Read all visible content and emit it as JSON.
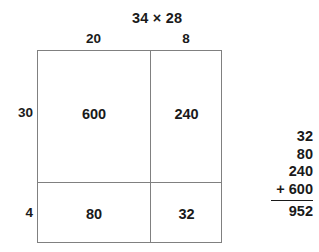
{
  "problem": {
    "title": "34 × 28",
    "multiplicand": "34",
    "multiplier": "28"
  },
  "area_model": {
    "column_headers": [
      "20",
      "8"
    ],
    "row_headers": [
      "30",
      "4"
    ],
    "cells": [
      [
        "600",
        "240"
      ],
      [
        "80",
        "32"
      ]
    ]
  },
  "addition": {
    "addends": [
      "32",
      "80",
      "240",
      "+ 600"
    ],
    "total": "952"
  },
  "colors": {
    "grid_line": "#808080",
    "text": "#1a1a1a",
    "rule_line": "#1a1a1a",
    "background": "#ffffff"
  },
  "chart_data": {
    "type": "table",
    "title": "34 × 28",
    "xlabel": "",
    "ylabel": "",
    "categories": [
      "20",
      "8"
    ],
    "series": [
      {
        "name": "30",
        "values": [
          600,
          240
        ]
      },
      {
        "name": "4",
        "values": [
          80,
          32
        ]
      }
    ],
    "annotations": [
      "32",
      "80",
      "240",
      "+ 600",
      "952"
    ],
    "legend": "none",
    "grid": true
  }
}
